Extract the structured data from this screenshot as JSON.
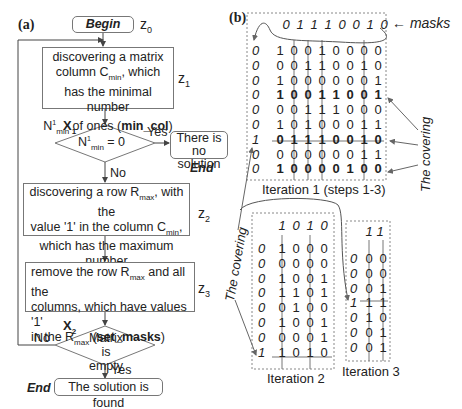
{
  "panel_a": {
    "label": "(a)",
    "begin": "Begin",
    "z0": "z",
    "z0_sub": "0",
    "step_z1": {
      "line1": "discovering a matrix",
      "line2a": "column C",
      "line2_sub": "min",
      "line2b": ", which",
      "line3": "has the minimal number",
      "line4a": "N",
      "line4_sup": "1",
      "line4_sub": "min",
      "line4b": " of ones (",
      "line4_bold": "min_col",
      "line4c": ")",
      "z": "z",
      "z_sub": "1"
    },
    "decision_x1": {
      "label": "X",
      "label_sub": "1",
      "cond_a": "N",
      "cond_sup": "1",
      "cond_sub": "min",
      "cond_b": " = 0",
      "yes": "Yes",
      "no": "No",
      "no_solution_line1": "There is no",
      "no_solution_line2": "solution",
      "end": "End"
    },
    "step_z2": {
      "line1a": "discovering a row R",
      "line1_sub": "max",
      "line1b": ", with the",
      "line2a": "value '1' in the column C",
      "line2_sub": "min",
      "line2b": ",",
      "line3": "which has the maximum number",
      "line4a": "N",
      "line4_sup": "1",
      "line4_sub": "max",
      "line4b": " of ones (",
      "line4_bold": "max_row",
      "line4c": ")",
      "z": "z",
      "z_sub": "2"
    },
    "step_z3": {
      "line1a": "remove the row R",
      "line1_sub": "max",
      "line1b": " and all the",
      "line2": "columns, which have values '1'",
      "line3a": "in the R",
      "line3_sub": "max",
      "line3b": " (",
      "line3_bold": "set_masks",
      "line3c": ")",
      "z": "z",
      "z_sub": "3"
    },
    "decision_x2": {
      "label": "X",
      "label_sub": "2",
      "cond_line1": "Matrix is",
      "cond_line2": "empty",
      "yes": "Yes",
      "no": "No"
    },
    "end_label": "End",
    "solution_found": "The solution is found"
  },
  "panel_b": {
    "label": "(b)",
    "masks_label": "← masks",
    "covering_label": "The covering",
    "iteration1": {
      "caption": "Iteration 1 (steps 1-3)",
      "masks": [
        "0",
        "1",
        "1",
        "1",
        "0",
        "0",
        "1",
        "0"
      ],
      "row_masks": [
        "0",
        "0",
        "0",
        "0",
        "0",
        "0",
        "1",
        "0",
        "0"
      ],
      "rows": [
        [
          "1",
          "0",
          "0",
          "1",
          "0",
          "0",
          "0",
          "0"
        ],
        [
          "0",
          "0",
          "1",
          "1",
          "0",
          "0",
          "1",
          "0"
        ],
        [
          "1",
          "0",
          "0",
          "0",
          "0",
          "0",
          "0",
          "1"
        ],
        [
          "1",
          "0",
          "0",
          "1",
          "1",
          "0",
          "0",
          "1"
        ],
        [
          "0",
          "0",
          "1",
          "1",
          "1",
          "0",
          "0",
          "0"
        ],
        [
          "1",
          "0",
          "1",
          "0",
          "0",
          "0",
          "1",
          "1"
        ],
        [
          "0",
          "1",
          "1",
          "1",
          "0",
          "0",
          "1",
          "0"
        ],
        [
          "0",
          "0",
          "0",
          "0",
          "0",
          "0",
          "1",
          "1"
        ],
        [
          "1",
          "0",
          "0",
          "0",
          "0",
          "1",
          "0",
          "0"
        ]
      ],
      "bold_rows": [
        3,
        6,
        8
      ],
      "struck_row": 6
    },
    "iteration2": {
      "caption": "Iteration 2",
      "masks": [
        "1",
        "0",
        "1",
        "0"
      ],
      "row_masks": [
        "0",
        "0",
        "0",
        "0",
        "0",
        "0",
        "0",
        "1"
      ],
      "rows": [
        [
          "1",
          "0",
          "0",
          "0"
        ],
        [
          "0",
          "0",
          "0",
          "0"
        ],
        [
          "1",
          "0",
          "0",
          "1"
        ],
        [
          "1",
          "1",
          "0",
          "1"
        ],
        [
          "0",
          "1",
          "0",
          "0"
        ],
        [
          "1",
          "0",
          "0",
          "1"
        ],
        [
          "0",
          "0",
          "0",
          "1"
        ],
        [
          "1",
          "0",
          "1",
          "0"
        ]
      ],
      "struck_row": 7
    },
    "iteration3": {
      "caption": "Iteration 3",
      "masks": [
        "1",
        "1"
      ],
      "row_masks": [
        "0",
        "0",
        "0",
        "1",
        "0",
        "0",
        "0"
      ],
      "rows": [
        [
          "0",
          "0"
        ],
        [
          "0",
          "0"
        ],
        [
          "0",
          "1"
        ],
        [
          "1",
          "1"
        ],
        [
          "1",
          "0"
        ],
        [
          "0",
          "1"
        ],
        [
          "0",
          "1"
        ]
      ],
      "struck_row": 3
    }
  }
}
